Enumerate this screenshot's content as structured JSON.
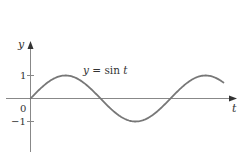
{
  "chart_data": {
    "type": "line",
    "title": "",
    "xlabel": "t",
    "ylabel": "y",
    "annotation": "y = sin t",
    "series": [
      {
        "name": "y = sin t",
        "function": "sin(t)",
        "t_range": [
          0,
          8.66
        ]
      }
    ],
    "y_ticks": [
      {
        "value": 1,
        "label": "1"
      },
      {
        "value": 0,
        "label": "0"
      },
      {
        "value": -1,
        "label": "−1"
      }
    ],
    "xlim": [
      0,
      9.6
    ],
    "ylim": [
      -2.5,
      2.6
    ],
    "grid": false,
    "legend": "none",
    "colors": {
      "curve": "#777777",
      "axes": "#888888",
      "text": "#333333"
    }
  },
  "labels": {
    "y_axis": "y",
    "x_axis": "t",
    "tick_1": "1",
    "tick_0": "0",
    "tick_neg1": "−1",
    "curve_y": "y",
    "curve_eq": " = sin ",
    "curve_t": "t"
  }
}
